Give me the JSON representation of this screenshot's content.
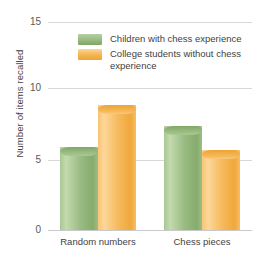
{
  "chart_data": {
    "type": "bar",
    "title": "",
    "xlabel": "",
    "ylabel": "Number of items recalled",
    "categories": [
      "Random numbers",
      "Chess pieces"
    ],
    "series": [
      {
        "name": "Children with chess experience",
        "color": "#9dbf86",
        "values": [
          6.0,
          7.5
        ]
      },
      {
        "name": "College students without chess experience",
        "color": "#f5b95a",
        "values": [
          9.0,
          5.8
        ]
      }
    ],
    "ylim": [
      0,
      15
    ],
    "yticks": [
      0,
      5,
      10,
      15
    ],
    "ytick_labels": [
      "0",
      "5",
      "10",
      "15"
    ],
    "grid": true,
    "legend_position": "top-right-inside"
  },
  "legend": {
    "items": [
      {
        "label": "Children with chess experience",
        "swatch": "green-swatch"
      },
      {
        "label": "College students without chess experience",
        "swatch": "orange-swatch"
      }
    ]
  },
  "axes": {
    "y_title": "Number of items recalled",
    "y_ticks": [
      "15",
      "10",
      "5",
      "0"
    ],
    "x_ticks": [
      "Random numbers",
      "Chess pieces"
    ]
  }
}
